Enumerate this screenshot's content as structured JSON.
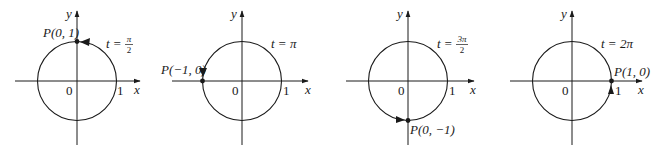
{
  "figure": {
    "axis_labels": {
      "x": "x",
      "y": "y"
    },
    "origin_label": "0",
    "unit_label": "1",
    "stroke_color": "#1a1a1a",
    "panels": [
      {
        "id": "t-pi-over-2",
        "t_prefix": "t =",
        "t_num": "π",
        "t_den": "2",
        "point_label": "P(0, 1)",
        "point": [
          0,
          1
        ]
      },
      {
        "id": "t-pi",
        "t_label": "t = π",
        "point_label": "P(−1, 0)",
        "point": [
          -1,
          0
        ]
      },
      {
        "id": "t-3pi-over-2",
        "t_prefix": "t =",
        "t_num": "3π",
        "t_den": "2",
        "point_label": "P(0, −1)",
        "point": [
          0,
          -1
        ]
      },
      {
        "id": "t-2pi",
        "t_label": "t = 2π",
        "point_label": "P(1, 0)",
        "point": [
          1,
          0
        ]
      }
    ]
  }
}
